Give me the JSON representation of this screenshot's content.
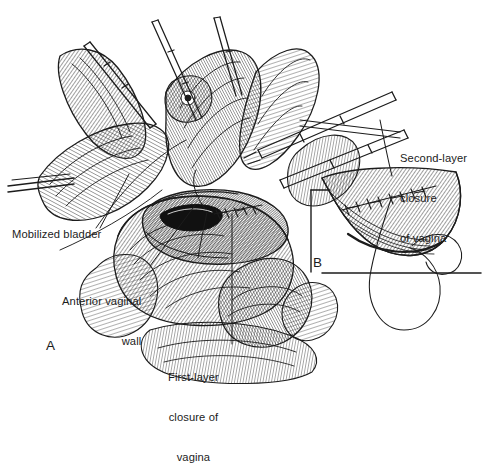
{
  "figure": {
    "type": "medical-surgical-illustration",
    "style": "black-and-white pen-and-ink cross-hatch line drawing",
    "background_color": "#ffffff",
    "ink_color": "#1c1c1c"
  },
  "panels": [
    {
      "id": "A",
      "letter": "A",
      "description": "Main operative field view showing mobilized bladder retracted, anterior vaginal wall, open vaginal cuff and first-layer suture line, with surgical clamps and forceps"
    },
    {
      "id": "B",
      "letter": "B",
      "description": "Inset detail of the completed second-layer running closure of the vagina with curved needle and suture thread"
    }
  ],
  "labels": [
    {
      "id": "mobilized-bladder",
      "text": "Mobilized bladder",
      "lines": [
        "Mobilized bladder"
      ],
      "align": "left"
    },
    {
      "id": "anterior-vaginal-wall",
      "text": "Anterior vaginal wall",
      "lines": [
        "Anterior vaginal",
        "wall"
      ],
      "align": "right"
    },
    {
      "id": "first-layer-closure",
      "text": "First-layer closure of vagina",
      "lines": [
        "First-layer",
        "closure of",
        "vagina"
      ],
      "align": "center"
    },
    {
      "id": "second-layer-closure",
      "text": "Second-layer closure of vagina",
      "lines": [
        "Second-layer",
        "closure",
        "of vagina"
      ],
      "align": "left"
    }
  ],
  "label_text": {
    "mobilized_bladder": "Mobilized bladder",
    "anterior_vaginal_wall_l1": "Anterior vaginal",
    "anterior_vaginal_wall_l2": "wall",
    "first_layer_l1": "First-layer",
    "first_layer_l2": "closure of",
    "first_layer_l3": "vagina",
    "second_layer_l1": "Second-layer",
    "second_layer_l2": "closure",
    "second_layer_l3": "of vagina",
    "panel_a": "A",
    "panel_b": "B"
  }
}
